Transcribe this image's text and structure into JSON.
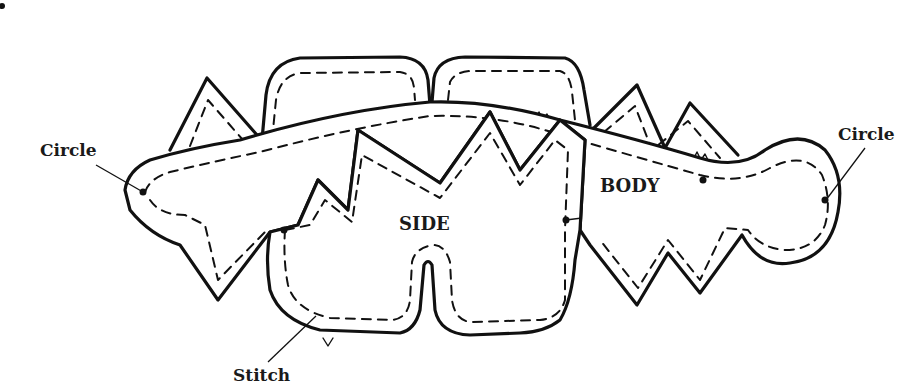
{
  "diagram": {
    "labels": {
      "circle_left": "Circle",
      "circle_right": "Circle",
      "stitch": "Stitch",
      "side": "SIDE",
      "body": "BODY"
    },
    "pieces": [
      {
        "name": "BODY",
        "description": "Long curved piece with zig-zag edges and rounded circular end"
      },
      {
        "name": "SIDE",
        "description": "Rounded piece with zig-zag top and two lobes at the bottom"
      }
    ],
    "legend": {
      "solid_line": "cut edge",
      "dashed_line": "stitch line",
      "dot": "circle marker"
    },
    "colors": {
      "ink": "#111111",
      "paper": "#ffffff"
    }
  }
}
